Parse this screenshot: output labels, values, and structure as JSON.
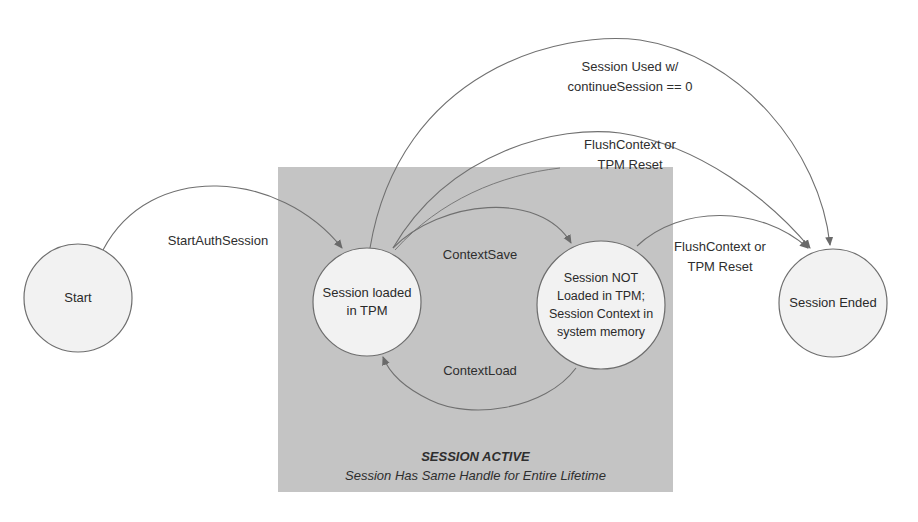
{
  "diagram": {
    "colors": {
      "background": "#ffffff",
      "active_region_fill": "#c4c4c4",
      "node_fill": "#f2f2f2",
      "node_stroke": "#6e6e6e",
      "edge_stroke": "#707070",
      "text": "#2a2a2a"
    },
    "region": {
      "name": "session-active",
      "title": "SESSION ACTIVE",
      "subtitle": "Session Has Same Handle for Entire Lifetime"
    },
    "nodes": [
      {
        "id": "start",
        "label": "Start"
      },
      {
        "id": "session-loaded",
        "label": "Session loaded\nin TPM"
      },
      {
        "id": "session-not-loaded",
        "label": "Session NOT\nLoaded  in TPM;\nSession Context in\nsystem memory"
      },
      {
        "id": "session-ended",
        "label": "Session Ended"
      }
    ],
    "edges": [
      {
        "from": "start",
        "to": "session-loaded",
        "label": "StartAuthSession"
      },
      {
        "from": "session-loaded",
        "to": "session-not-loaded",
        "label": "ContextSave"
      },
      {
        "from": "session-not-loaded",
        "to": "session-loaded",
        "label": "ContextLoad"
      },
      {
        "from": "session-loaded",
        "to": "session-ended",
        "label_line1": "Session Used w/",
        "label_line2": "continueSession == 0"
      },
      {
        "from": "session-loaded",
        "to": "session-ended",
        "label_line1": "FlushContext or",
        "label_line2": "TPM Reset"
      },
      {
        "from": "session-not-loaded",
        "to": "session-ended",
        "label_line1": "FlushContext or",
        "label_line2": "TPM Reset"
      }
    ]
  }
}
